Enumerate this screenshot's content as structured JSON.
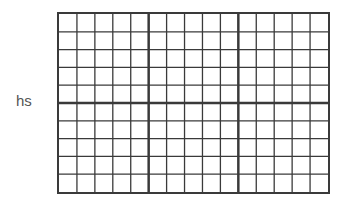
{
  "label": "hs",
  "grid": {
    "columns": 15,
    "rows": 10,
    "major_column_every": 5,
    "major_row_every": 5,
    "line_color": "#3a3a3a",
    "label_color": "#555555"
  }
}
